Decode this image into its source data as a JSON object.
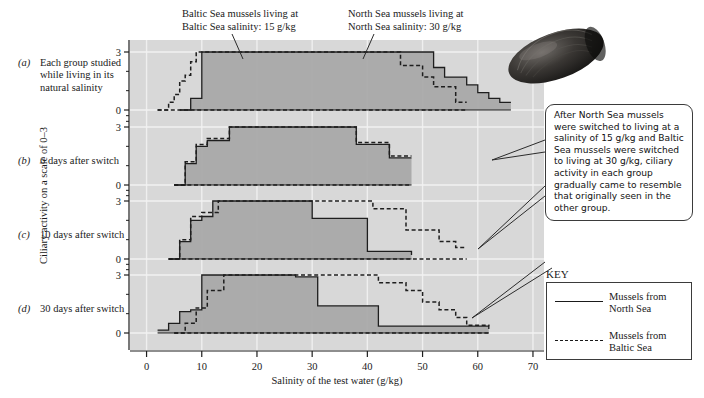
{
  "figure": {
    "y_axis_title": "Ciliary activity on a scale of 0–3",
    "x_axis_title": "Salinity of the test water (g/kg)"
  },
  "annotations": {
    "baltic": "Baltic Sea mussels living at\nBaltic Sea salinity: 15 g/kg",
    "north": "North Sea mussels living at\nNorth Sea salinity: 30 g/kg",
    "callout": "After North Sea mussels were switched to living at a salinity of 15 g/kg and Baltic Sea mussels were switched to living at 30 g/kg, ciliary activity in each group gradually came to resemble that originally seen in the other group."
  },
  "panels": [
    {
      "tag": "(a)",
      "label": "Each group studied while living in its natural salinity"
    },
    {
      "tag": "(b)",
      "label": "6 days after switch"
    },
    {
      "tag": "(c)",
      "label": "10 days after switch"
    },
    {
      "tag": "(d)",
      "label": "30 days after switch"
    }
  ],
  "key": {
    "title": "KEY",
    "entries": [
      {
        "style": "solid",
        "label": "Mussels from North Sea"
      },
      {
        "style": "dashed",
        "label": "Mussels from Baltic Sea"
      }
    ]
  },
  "chart_data": {
    "type": "line",
    "xlabel": "Salinity of the test water (g/kg)",
    "ylabel": "Ciliary activity on a scale of 0–3",
    "xlim": [
      -3,
      72
    ],
    "ylim": [
      0,
      3
    ],
    "xticks": [
      0,
      10,
      20,
      30,
      40,
      50,
      60,
      70
    ],
    "yticks": [
      0,
      3
    ],
    "ytick_labels": [
      "0",
      "3"
    ],
    "grid": true,
    "legend": {
      "position": "right",
      "entries": [
        "Mussels from North Sea",
        "Mussels from Baltic Sea"
      ]
    },
    "step_type": "post",
    "panels": [
      {
        "tag": "(a)",
        "label": "Each group studied while living in its natural salinity",
        "series": [
          {
            "name": "Mussels from North Sea",
            "style": "solid",
            "filled": true,
            "x": [
              6,
              8,
              10,
              46,
              48,
              52,
              54,
              58,
              60,
              62,
              64,
              66
            ],
            "y": [
              0,
              0.6,
              3.0,
              3.0,
              3.0,
              2.2,
              1.7,
              1.3,
              0.9,
              0.6,
              0.4,
              0.4
            ]
          },
          {
            "name": "Mussels from Baltic Sea",
            "style": "dashed",
            "filled": false,
            "x": [
              2,
              4,
              5,
              6,
              7,
              8,
              9,
              44,
              46,
              50,
              52,
              56,
              58
            ],
            "y": [
              0,
              0.4,
              0.8,
              1.5,
              1.8,
              2.5,
              3.0,
              3.0,
              2.3,
              1.7,
              1.2,
              0.4,
              0.4
            ]
          }
        ]
      },
      {
        "tag": "(b)",
        "label": "6 days after switch",
        "series": [
          {
            "name": "Mussels from North Sea",
            "style": "solid",
            "filled": true,
            "x": [
              5,
              7,
              9,
              11,
              15,
              36,
              38,
              42,
              44,
              48
            ],
            "y": [
              0,
              1.1,
              2.0,
              2.3,
              3.0,
              3.0,
              2.1,
              2.1,
              1.4,
              1.4
            ]
          },
          {
            "name": "Mussels from Baltic Sea",
            "style": "dashed",
            "filled": false,
            "x": [
              5,
              7,
              9,
              11,
              15,
              36,
              38,
              42,
              44,
              48
            ],
            "y": [
              0,
              1.2,
              2.1,
              2.4,
              3.0,
              3.0,
              2.2,
              2.2,
              1.5,
              1.5
            ]
          }
        ]
      },
      {
        "tag": "(c)",
        "label": "10 days after switch",
        "series": [
          {
            "name": "Mussels from North Sea",
            "style": "solid",
            "filled": true,
            "x": [
              4,
              6,
              8,
              10,
              12,
              26,
              30,
              36,
              40,
              44,
              48
            ],
            "y": [
              0,
              0.9,
              2.0,
              2.2,
              3.0,
              3.0,
              2.1,
              2.1,
              0.4,
              0.4,
              0.2
            ]
          },
          {
            "name": "Mussels from Baltic Sea",
            "style": "dashed",
            "filled": false,
            "x": [
              4,
              6,
              8,
              10,
              13,
              36,
              41,
              45,
              47,
              51,
              53,
              56,
              58
            ],
            "y": [
              0,
              1.0,
              2.2,
              2.4,
              3.0,
              3.0,
              2.6,
              2.6,
              1.5,
              1.5,
              0.9,
              0.6,
              0.6
            ]
          }
        ]
      },
      {
        "tag": "(d)",
        "label": "30 days after switch",
        "series": [
          {
            "name": "Mussels from North Sea",
            "style": "solid",
            "filled": true,
            "x": [
              2,
              4,
              6,
              8,
              10,
              22,
              27,
              31,
              36,
              42,
              48,
              62
            ],
            "y": [
              0.15,
              0.5,
              1.1,
              1.2,
              3.0,
              3.0,
              2.9,
              1.4,
              1.4,
              0.35,
              0.35,
              0.2
            ]
          },
          {
            "name": "Mussels from Baltic Sea",
            "style": "dashed",
            "filled": false,
            "x": [
              5,
              7,
              9,
              11,
              14,
              38,
              42,
              47,
              50,
              53,
              56,
              58,
              62
            ],
            "y": [
              0,
              0.5,
              1.3,
              2.2,
              3.0,
              3.0,
              2.6,
              2.2,
              1.6,
              1.2,
              0.8,
              0.4,
              0.35
            ]
          }
        ]
      }
    ]
  }
}
